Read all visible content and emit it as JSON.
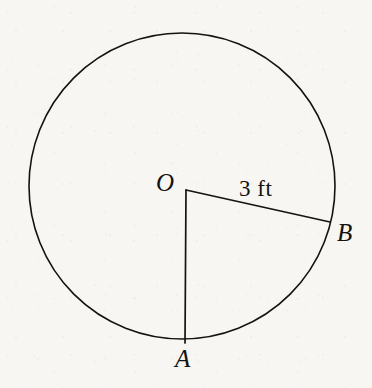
{
  "figure": {
    "kind": "circle-sector-diagram",
    "background_color": "#f7f6f3",
    "ink_color": "#15120f",
    "stroke_width": 1.6,
    "circle": {
      "center_x": 182,
      "center_y": 186,
      "radius": 153
    },
    "points": {
      "center": {
        "label": "O",
        "x": 186,
        "y": 190
      },
      "a": {
        "label": "A",
        "x": 185,
        "y": 343
      },
      "b": {
        "label": "B",
        "x": 330,
        "y": 222
      }
    },
    "radii": [
      {
        "name": "OA",
        "from": "center",
        "to": "a"
      },
      {
        "name": "OB",
        "from": "center",
        "to": "b"
      }
    ],
    "measurements": {
      "radius_length": "3 ft",
      "radius_value": 3,
      "radius_unit": "ft",
      "labeled_segment": "OB"
    }
  }
}
